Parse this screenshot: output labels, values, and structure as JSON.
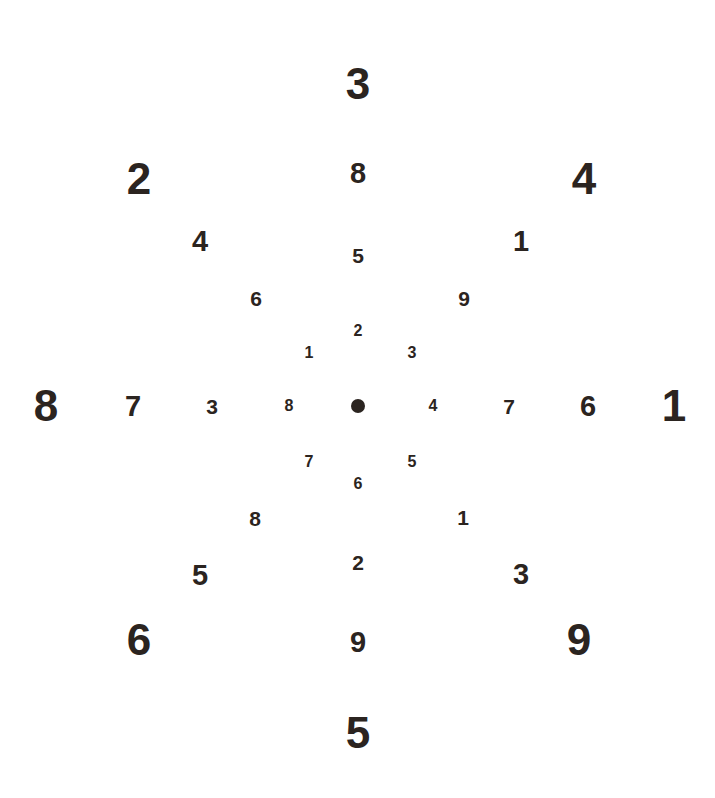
{
  "chart_data": {
    "type": "scatter",
    "title": "",
    "xlabel": "",
    "ylabel": "",
    "background_color": "#ffffff",
    "ink_color": "#2b2420",
    "center": {
      "x": 358,
      "y": 406,
      "marker": "filled-circle",
      "diameter_px": 14
    },
    "ring_count": 4,
    "arms": [
      "N",
      "NE",
      "E",
      "SE",
      "S",
      "SW",
      "W",
      "NW"
    ],
    "ring_font_sizes_px": [
      16,
      21,
      29,
      44
    ],
    "series": [
      {
        "name": "ring-1",
        "ring": 1,
        "font_size_px": 16,
        "values": [
          2,
          3,
          4,
          5,
          6,
          7,
          8,
          1
        ],
        "points": [
          {
            "label": "2",
            "arm": "N",
            "x": 358,
            "y": 331
          },
          {
            "label": "3",
            "arm": "NE",
            "x": 412,
            "y": 353
          },
          {
            "label": "4",
            "arm": "E",
            "x": 433,
            "y": 406
          },
          {
            "label": "5",
            "arm": "SE",
            "x": 412,
            "y": 462
          },
          {
            "label": "6",
            "arm": "S",
            "x": 358,
            "y": 484
          },
          {
            "label": "7",
            "arm": "SW",
            "x": 309,
            "y": 462
          },
          {
            "label": "8",
            "arm": "W",
            "x": 289,
            "y": 406
          },
          {
            "label": "1",
            "arm": "NW",
            "x": 309,
            "y": 353
          }
        ]
      },
      {
        "name": "ring-2",
        "ring": 2,
        "font_size_px": 21,
        "values": [
          5,
          9,
          7,
          1,
          2,
          8,
          3,
          6
        ],
        "points": [
          {
            "label": "5",
            "arm": "N",
            "x": 358,
            "y": 255
          },
          {
            "label": "9",
            "arm": "NE",
            "x": 464,
            "y": 298
          },
          {
            "label": "7",
            "arm": "E",
            "x": 509,
            "y": 406
          },
          {
            "label": "1",
            "arm": "SE",
            "x": 463,
            "y": 517
          },
          {
            "label": "2",
            "arm": "S",
            "x": 358,
            "y": 562
          },
          {
            "label": "8",
            "arm": "SW",
            "x": 255,
            "y": 518
          },
          {
            "label": "3",
            "arm": "W",
            "x": 212,
            "y": 406
          },
          {
            "label": "6",
            "arm": "NW",
            "x": 256,
            "y": 298
          }
        ]
      },
      {
        "name": "ring-3",
        "ring": 3,
        "font_size_px": 29,
        "values": [
          8,
          1,
          6,
          3,
          9,
          5,
          7,
          4
        ],
        "points": [
          {
            "label": "8",
            "arm": "N",
            "x": 358,
            "y": 173
          },
          {
            "label": "1",
            "arm": "NE",
            "x": 521,
            "y": 241
          },
          {
            "label": "6",
            "arm": "E",
            "x": 588,
            "y": 406
          },
          {
            "label": "3",
            "arm": "SE",
            "x": 521,
            "y": 574
          },
          {
            "label": "9",
            "arm": "S",
            "x": 358,
            "y": 642
          },
          {
            "label": "5",
            "arm": "SW",
            "x": 200,
            "y": 575
          },
          {
            "label": "7",
            "arm": "W",
            "x": 133,
            "y": 406
          },
          {
            "label": "4",
            "arm": "NW",
            "x": 200,
            "y": 241
          }
        ]
      },
      {
        "name": "ring-4",
        "ring": 4,
        "font_size_px": 44,
        "values": [
          3,
          4,
          1,
          9,
          5,
          6,
          8,
          2
        ],
        "points": [
          {
            "label": "3",
            "arm": "N",
            "x": 358,
            "y": 84
          },
          {
            "label": "4",
            "arm": "NE",
            "x": 584,
            "y": 179
          },
          {
            "label": "1",
            "arm": "E",
            "x": 674,
            "y": 406
          },
          {
            "label": "9",
            "arm": "SE",
            "x": 579,
            "y": 640
          },
          {
            "label": "5",
            "arm": "S",
            "x": 358,
            "y": 733
          },
          {
            "label": "6",
            "arm": "SW",
            "x": 139,
            "y": 640
          },
          {
            "label": "8",
            "arm": "W",
            "x": 46,
            "y": 406
          },
          {
            "label": "2",
            "arm": "NW",
            "x": 139,
            "y": 179
          }
        ]
      }
    ]
  }
}
